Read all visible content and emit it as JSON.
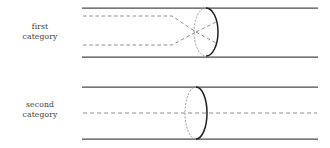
{
  "figure": {
    "background_color": "#ffffff",
    "width": 330,
    "height": 148,
    "colors": {
      "tube_wall": "#4a4a4a",
      "ray_dashed": "#8e8e8e",
      "ellipse_solid": "#1f1f1f",
      "ellipse_hidden": "#9a9a9a",
      "label_text": "#3a3a3a"
    }
  },
  "rows": [
    {
      "id": "first",
      "label_lines": [
        "first",
        "category"
      ],
      "tube": {
        "x_start": 82,
        "x_end": 318,
        "top_y": 8,
        "bottom_y": 57
      },
      "rays": [
        {
          "name": "upper-ray",
          "entry_y": 16,
          "style": "dashed"
        },
        {
          "name": "lower-ray",
          "entry_y": 45,
          "style": "dashed"
        }
      ],
      "ray_behavior": "converge-and-cross",
      "focal_point": {
        "x": 196,
        "y": 32
      },
      "ellipse": {
        "center_x": 206,
        "center_y": 32,
        "radius_x": 12,
        "radius_y": 24,
        "solid_side": "right",
        "hidden_side": "left"
      }
    },
    {
      "id": "second",
      "label_lines": [
        "second",
        "category"
      ],
      "tube": {
        "x_start": 82,
        "x_end": 318,
        "top_y": 87,
        "bottom_y": 139
      },
      "rays": [
        {
          "name": "axis-ray",
          "entry_y": 113,
          "style": "dashed"
        }
      ],
      "ray_behavior": "straight-through",
      "focal_point": null,
      "ellipse": {
        "center_x": 196,
        "center_y": 113,
        "radius_x": 11,
        "radius_y": 26,
        "solid_side": "right",
        "hidden_side": "left"
      }
    }
  ]
}
